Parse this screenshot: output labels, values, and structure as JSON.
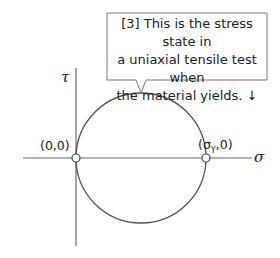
{
  "diagram": {
    "type": "mohr-circle",
    "axes": {
      "horizontal_label": "σ",
      "vertical_label": "τ"
    },
    "points": [
      {
        "label": "(0,0)"
      },
      {
        "label_prefix": "(σ",
        "label_sub": "Y",
        "label_suffix": ",0)"
      }
    ],
    "callout": {
      "lines": [
        "[3] This is the stress state in",
        "a uniaxial tensile test when",
        "the material yields. ↓"
      ]
    },
    "colors": {
      "line": "#555555",
      "axis": "#666666",
      "text": "#222222",
      "background": "#ffffff"
    }
  }
}
